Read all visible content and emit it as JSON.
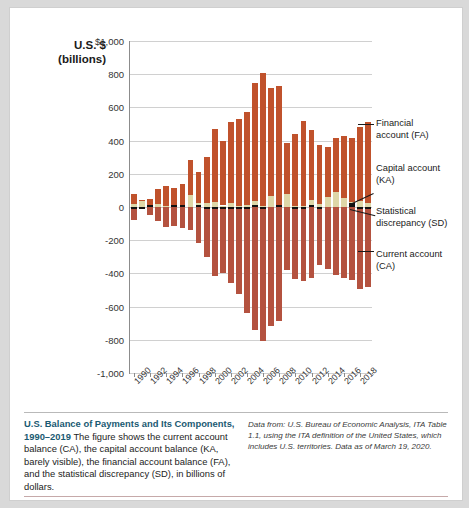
{
  "figure": {
    "y_axis_title_line1": "U.S. $",
    "y_axis_title_line2": "(billions)"
  },
  "legend": {
    "financial_line1": "Financial",
    "financial_line2": "account (FA)",
    "capital_line1": "Capital account",
    "capital_line2": "(KA)",
    "statistical_line1": "Statistical",
    "statistical_line2": "discrepancy (SD)",
    "current_line1": "Current account",
    "current_line2": "(CA)"
  },
  "caption": {
    "title": "U.S. Balance of Payments and Its Components, 1990–2019",
    "body": "The figure shows the current account balance (CA), the capital account balance (KA, barely visible), the financial account balance (FA), and the statistical discrepancy (SD), in billions of dollars.",
    "source": "Data from: U.S. Bureau of Economic Analysis, ITA Table 1.1, using the ITA definition of the United States, which includes U.S. territories. Data as of March 19, 2020."
  },
  "chart_data": {
    "type": "bar",
    "title": "U.S. Balance of Payments and Its Components, 1990–2019",
    "xlabel": "",
    "ylabel": "U.S. $ (billions)",
    "ylim": [
      -1000,
      1000
    ],
    "ytick_labels": [
      "$1,000",
      "800",
      "600",
      "400",
      "200",
      "0",
      "-200",
      "-400",
      "-600",
      "-800",
      "-1,000"
    ],
    "ytick_values": [
      1000,
      800,
      600,
      400,
      200,
      0,
      -200,
      -400,
      -600,
      -800,
      -1000
    ],
    "grid": true,
    "legend_position": "right",
    "stacked": true,
    "x": [
      1990,
      1991,
      1992,
      1993,
      1994,
      1995,
      1996,
      1997,
      1998,
      1999,
      2000,
      2001,
      2002,
      2003,
      2004,
      2005,
      2006,
      2007,
      2008,
      2009,
      2010,
      2011,
      2012,
      2013,
      2014,
      2015,
      2016,
      2017,
      2018,
      2019
    ],
    "xtick_labels": [
      "1990",
      "1992",
      "1994",
      "1996",
      "1998",
      "2000",
      "2002",
      "2004",
      "2006",
      "2008",
      "2010",
      "2012",
      "2014",
      "2016",
      "2018"
    ],
    "colors": {
      "financial_account": "#c0522c",
      "capital_account": "#111111",
      "statistical_discrepancy": "#ded7a8",
      "current_account": "#b4523f",
      "caption_title": "#1a5a72"
    },
    "series": [
      {
        "name": "Financial account (FA)",
        "key": "FA",
        "values": [
          59,
          3,
          45,
          89,
          117,
          100,
          131,
          212,
          190,
          278,
          436,
          391,
          487,
          523,
          565,
          712,
          799,
          653,
          712,
          305,
          437,
          516,
          425,
          356,
          300,
          325,
          372,
          385,
          448,
          486
        ]
      },
      {
        "name": "Capital account (KA)",
        "key": "KA",
        "values": [
          -7,
          -4,
          1,
          0,
          0,
          1,
          1,
          0,
          1,
          -5,
          -1,
          -1,
          -1,
          -3,
          -2,
          13,
          -2,
          0,
          6,
          0,
          -1,
          -1,
          7,
          -1,
          0,
          0,
          0,
          25,
          -4,
          -6
        ]
      },
      {
        "name": "Statistical discrepancy (SD)",
        "key": "SD",
        "values": [
          19,
          38,
          1,
          21,
          9,
          14,
          6,
          71,
          23,
          22,
          32,
          9,
          27,
          5,
          10,
          38,
          7,
          65,
          14,
          79,
          5,
          4,
          40,
          18,
          63,
          93,
          57,
          29,
          36,
          26
        ]
      },
      {
        "name": "Current account (CA)",
        "key": "CA",
        "values": [
          -79,
          -3,
          -51,
          -85,
          -122,
          -114,
          -125,
          -141,
          -215,
          -301,
          -416,
          -397,
          -459,
          -522,
          -640,
          -740,
          -807,
          -719,
          -687,
          -381,
          -432,
          -446,
          -426,
          -349,
          -373,
          -408,
          -428,
          -440,
          -491,
          -480
        ]
      }
    ]
  }
}
